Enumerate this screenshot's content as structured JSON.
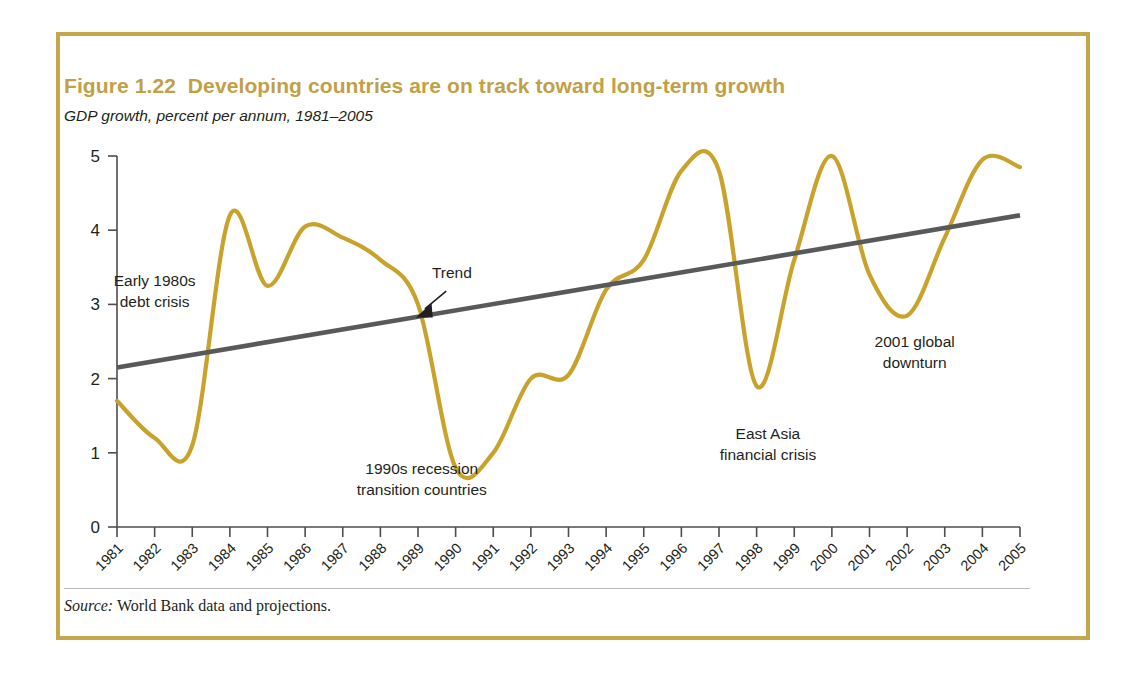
{
  "figure": {
    "label": "Figure 1.22",
    "title": "Figure 1.22  Developing countries are on track toward long-term growth",
    "subtitle": "GDP growth, percent per annum, 1981–2005",
    "source_label": "Source:",
    "source_text": " World Bank data and projections.",
    "border_color": "#C6A64C",
    "title_color": "#C1A047"
  },
  "chart_data": {
    "type": "line",
    "title": "Developing countries are on track toward long-term growth",
    "subtitle": "GDP growth, percent per annum, 1981–2005",
    "xlabel": "",
    "ylabel": "",
    "ylim": [
      0,
      5
    ],
    "xlim": [
      1981,
      2005
    ],
    "grid": false,
    "legend": "none",
    "yticks": [
      "0",
      "1",
      "2",
      "3",
      "4",
      "5"
    ],
    "xticks": [
      "1981",
      "1982",
      "1983",
      "1984",
      "1985",
      "1986",
      "1987",
      "1988",
      "1989",
      "1990",
      "1991",
      "1992",
      "1993",
      "1994",
      "1995",
      "1996",
      "1997",
      "1998",
      "1999",
      "2000",
      "2001",
      "2002",
      "2003",
      "2004",
      "2005"
    ],
    "series": [
      {
        "name": "GDP growth",
        "color": "#C9A22C",
        "x": [
          1981,
          1982,
          1983,
          1984,
          1985,
          1986,
          1987,
          1988,
          1989,
          1990,
          1991,
          1992,
          1993,
          1994,
          1995,
          1996,
          1997,
          1998,
          1999,
          2000,
          2001,
          2002,
          2003,
          2004,
          2005
        ],
        "values": [
          1.7,
          1.2,
          1.1,
          4.2,
          3.25,
          4.05,
          3.9,
          3.6,
          3.0,
          0.8,
          1.0,
          2.0,
          2.05,
          3.2,
          3.6,
          4.8,
          4.8,
          1.9,
          3.6,
          5.0,
          3.4,
          2.85,
          3.9,
          4.95,
          4.85
        ]
      },
      {
        "name": "Trend",
        "color": "#58595B",
        "x": [
          1981,
          2005
        ],
        "values": [
          2.15,
          4.2
        ]
      }
    ],
    "annotations": [
      {
        "name": "early-1980s-debt-crisis",
        "lines": [
          "Early 1980s",
          "debt crisis"
        ],
        "x": 1982.0,
        "y": 3.25
      },
      {
        "name": "trend-label",
        "lines": [
          "Trend"
        ],
        "x": 1989.9,
        "y": 3.35
      },
      {
        "name": "1990s-recession",
        "lines": [
          "1990s recession",
          "transition countries"
        ],
        "x": 1989.1,
        "y": 0.72
      },
      {
        "name": "east-asia-financial-crisis",
        "lines": [
          "East Asia",
          "financial crisis"
        ],
        "x": 1998.3,
        "y": 1.18
      },
      {
        "name": "2001-global-downturn",
        "lines": [
          "2001 global",
          "downturn"
        ],
        "x": 2002.2,
        "y": 2.42
      }
    ]
  }
}
